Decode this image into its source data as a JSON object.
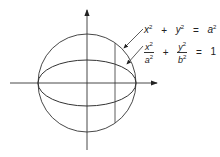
{
  "diagram": {
    "labels": {
      "circle_equation": {
        "lhs_x": "x",
        "plus": "+",
        "lhs_y": "y",
        "eq": "=",
        "rhs": "a",
        "exp": "2"
      },
      "ellipse_equation": {
        "num1": "x",
        "den1": "a",
        "plus": "+",
        "num2": "y",
        "den2": "b",
        "eq": "=",
        "rhs": "1",
        "exp": "2"
      }
    },
    "colors": {
      "stroke": "#333333",
      "background": "#ffffff"
    },
    "geometry": {
      "center": [
        87,
        83
      ],
      "circle_radius": 49,
      "ellipse_semi_axes": [
        49,
        23
      ],
      "vertical_line_x": 115
    }
  }
}
